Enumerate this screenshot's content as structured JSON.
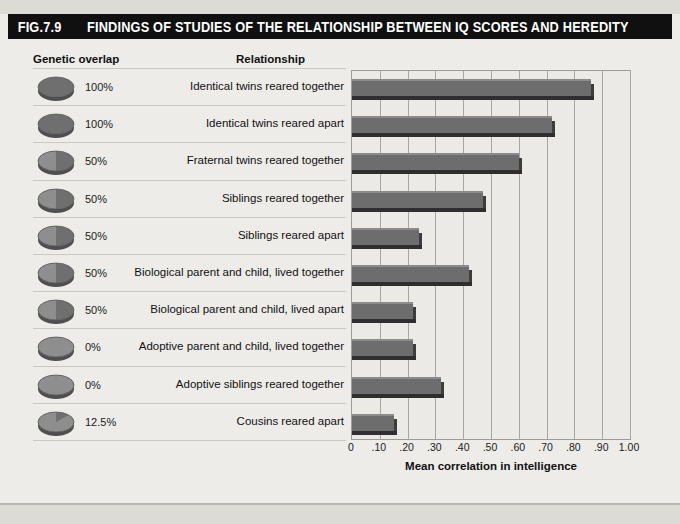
{
  "figure": {
    "number": "FIG.7.9",
    "title": "FINDINGS OF STUDIES OF THE RELATIONSHIP BETWEEN IQ SCORES AND HEREDITY"
  },
  "columns": {
    "genetic_overlap": "Genetic overlap",
    "relationship": "Relationship"
  },
  "colors": {
    "title_bar": "#111010",
    "title_text": "#ffffff",
    "bar_face": "#6d6d6d",
    "bar_highlight": "#8c8c8c",
    "bar_shadow": "#2f2f2f",
    "plot_background": "#eceae6",
    "gridline": "#a8a7a2",
    "page_background": "#edece8"
  },
  "chart_data": {
    "type": "bar",
    "orientation": "horizontal",
    "title": "FINDINGS OF STUDIES OF THE RELATIONSHIP BETWEEN IQ SCORES AND HEREDITY",
    "xlabel": "Mean correlation in intelligence",
    "ylabel": "Relationship",
    "xlim": [
      0,
      1.0
    ],
    "grid": true,
    "legend": false,
    "xticks": [
      0,
      0.1,
      0.2,
      0.3,
      0.4,
      0.5,
      0.6,
      0.7,
      0.8,
      0.9,
      1.0
    ],
    "xticklabels": [
      "0",
      ".10",
      ".20",
      ".30",
      ".40",
      ".50",
      ".60",
      ".70",
      ".80",
      ".90",
      "1.00"
    ],
    "categories": [
      "Identical twins reared together",
      "Identical twins reared apart",
      "Fraternal twins reared together",
      "Siblings reared together",
      "Siblings reared apart",
      "Biological parent and child, lived together",
      "Biological parent and child, lived apart",
      "Adoptive parent and child, lived together",
      "Adoptive siblings reared together",
      "Cousins reared apart"
    ],
    "values": [
      0.86,
      0.72,
      0.6,
      0.47,
      0.24,
      0.42,
      0.22,
      0.22,
      0.32,
      0.15
    ],
    "genetic_overlap": [
      "100%",
      "100%",
      "50%",
      "50%",
      "50%",
      "50%",
      "50%",
      "0%",
      "0%",
      "12.5%"
    ],
    "genetic_overlap_fraction": [
      1.0,
      1.0,
      0.5,
      0.5,
      0.5,
      0.5,
      0.5,
      0.0,
      0.0,
      0.125
    ]
  },
  "rows": [
    {
      "pct": "100%",
      "frac": 1.0,
      "label": "Identical twins reared together",
      "value": 0.86
    },
    {
      "pct": "100%",
      "frac": 1.0,
      "label": "Identical twins reared apart",
      "value": 0.72
    },
    {
      "pct": "50%",
      "frac": 0.5,
      "label": "Fraternal twins reared together",
      "value": 0.6
    },
    {
      "pct": "50%",
      "frac": 0.5,
      "label": "Siblings reared together",
      "value": 0.47
    },
    {
      "pct": "50%",
      "frac": 0.5,
      "label": "Siblings reared apart",
      "value": 0.24
    },
    {
      "pct": "50%",
      "frac": 0.5,
      "label": "Biological parent and child, lived together",
      "value": 0.42
    },
    {
      "pct": "50%",
      "frac": 0.5,
      "label": "Biological parent and child, lived apart",
      "value": 0.22
    },
    {
      "pct": "0%",
      "frac": 0.0,
      "label": "Adoptive parent and child, lived together",
      "value": 0.22
    },
    {
      "pct": "0%",
      "frac": 0.0,
      "label": "Adoptive siblings reared together",
      "value": 0.32
    },
    {
      "pct": "12.5%",
      "frac": 0.125,
      "label": "Cousins reared apart",
      "value": 0.15
    }
  ],
  "axis": {
    "title": "Mean correlation in intelligence"
  }
}
